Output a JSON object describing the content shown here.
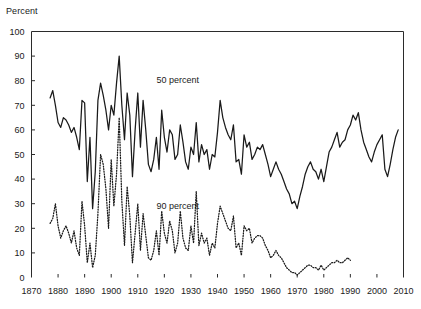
{
  "chart_data": {
    "type": "line",
    "title": "",
    "xlabel": "",
    "ylabel": "Percent",
    "ylim": [
      0,
      100
    ],
    "xlim": [
      1870,
      2010
    ],
    "grid": false,
    "legend_position": "inline-annotation",
    "yticks": [
      0,
      10,
      20,
      30,
      40,
      50,
      60,
      70,
      80,
      90,
      100
    ],
    "xticks": [
      1870,
      1880,
      1890,
      1900,
      1910,
      1920,
      1930,
      1940,
      1950,
      1960,
      1970,
      1980,
      1990,
      2000,
      2010
    ],
    "ytick_labels": [
      "0",
      "10",
      "20",
      "30",
      "40",
      "50",
      "60",
      "70",
      "80",
      "90",
      "100"
    ],
    "xtick_labels": [
      "1870",
      "1880",
      "1890",
      "1900",
      "1910",
      "1920",
      "1930",
      "1940",
      "1950",
      "1960",
      "1970",
      "1980",
      "1990",
      "2000",
      "2010"
    ],
    "annotations": [
      {
        "text": "50 percent",
        "x": 1917,
        "y": 79
      },
      {
        "text": "90 percent",
        "x": 1917,
        "y": 28
      }
    ],
    "series": [
      {
        "name": "50 percent",
        "style": "solid",
        "color": "#1a1a1a",
        "x": [
          1877,
          1878,
          1879,
          1880,
          1881,
          1882,
          1883,
          1884,
          1885,
          1886,
          1887,
          1888,
          1889,
          1890,
          1891,
          1892,
          1893,
          1894,
          1895,
          1896,
          1897,
          1898,
          1899,
          1900,
          1901,
          1902,
          1903,
          1904,
          1905,
          1906,
          1907,
          1908,
          1909,
          1910,
          1911,
          1912,
          1913,
          1914,
          1915,
          1916,
          1917,
          1918,
          1919,
          1920,
          1921,
          1922,
          1923,
          1924,
          1925,
          1926,
          1927,
          1928,
          1929,
          1930,
          1931,
          1932,
          1933,
          1934,
          1935,
          1936,
          1937,
          1938,
          1939,
          1940,
          1941,
          1942,
          1943,
          1944,
          1945,
          1946,
          1947,
          1948,
          1949,
          1950,
          1951,
          1952,
          1953,
          1954,
          1955,
          1956,
          1957,
          1958,
          1959,
          1960,
          1961,
          1962,
          1963,
          1964,
          1965,
          1966,
          1967,
          1968,
          1969,
          1970,
          1971,
          1972,
          1973,
          1974,
          1975,
          1976,
          1977,
          1978,
          1979,
          1980,
          1981,
          1982,
          1983,
          1984,
          1985,
          1986,
          1987,
          1988,
          1989,
          1990,
          1991,
          1992,
          1993,
          1994,
          1995,
          1996,
          1997,
          1998,
          1999,
          2000,
          2001,
          2002,
          2003,
          2004,
          2005,
          2006,
          2007,
          2008
        ],
        "values": [
          73,
          76,
          70,
          63,
          61,
          65,
          64,
          62,
          59,
          61,
          57,
          52,
          72,
          71,
          39,
          57,
          28,
          43,
          72,
          79,
          74,
          68,
          60,
          70,
          66,
          79,
          90,
          70,
          56,
          75,
          66,
          41,
          60,
          75,
          53,
          72,
          60,
          46,
          43,
          48,
          57,
          44,
          68,
          57,
          51,
          60,
          58,
          48,
          50,
          62,
          55,
          47,
          44,
          53,
          50,
          63,
          47,
          54,
          50,
          52,
          44,
          50,
          49,
          59,
          72,
          65,
          61,
          58,
          56,
          62,
          47,
          48,
          42,
          58,
          53,
          55,
          48,
          50,
          53,
          52,
          54,
          50,
          46,
          41,
          44,
          47,
          44,
          42,
          39,
          36,
          34,
          30,
          31,
          28,
          33,
          37,
          42,
          45,
          47,
          44,
          43,
          40,
          44,
          39,
          45,
          51,
          53,
          56,
          59,
          53,
          55,
          56,
          60,
          62,
          66,
          64,
          67,
          60,
          55,
          52,
          49,
          47,
          51,
          54,
          56,
          58,
          44,
          41,
          46,
          52,
          57,
          60
        ],
        "start_year": 1877,
        "end_year": 2008
      },
      {
        "name": "90 percent",
        "style": "dotted",
        "color": "#1a1a1a",
        "x": [
          1877,
          1878,
          1879,
          1880,
          1881,
          1882,
          1883,
          1884,
          1885,
          1886,
          1887,
          1888,
          1889,
          1890,
          1891,
          1892,
          1893,
          1894,
          1895,
          1896,
          1897,
          1898,
          1899,
          1900,
          1901,
          1902,
          1903,
          1904,
          1905,
          1906,
          1907,
          1908,
          1909,
          1910,
          1911,
          1912,
          1913,
          1914,
          1915,
          1916,
          1917,
          1918,
          1919,
          1920,
          1921,
          1922,
          1923,
          1924,
          1925,
          1926,
          1927,
          1928,
          1929,
          1930,
          1931,
          1932,
          1933,
          1934,
          1935,
          1936,
          1937,
          1938,
          1939,
          1940,
          1941,
          1942,
          1943,
          1944,
          1945,
          1946,
          1947,
          1948,
          1949,
          1950,
          1951,
          1952,
          1953,
          1954,
          1955,
          1956,
          1957,
          1958,
          1959,
          1960,
          1961,
          1962,
          1963,
          1964,
          1965,
          1966,
          1967,
          1968,
          1969,
          1970,
          1971,
          1972,
          1973,
          1974,
          1975,
          1976,
          1977,
          1978,
          1979,
          1980,
          1981,
          1982,
          1983,
          1984,
          1985,
          1986,
          1987,
          1988,
          1989,
          1990
        ],
        "values": [
          22,
          24,
          30,
          21,
          16,
          19,
          21,
          18,
          14,
          19,
          12,
          9,
          31,
          21,
          6,
          14,
          4,
          9,
          26,
          50,
          46,
          36,
          20,
          48,
          29,
          42,
          65,
          31,
          13,
          37,
          25,
          6,
          18,
          30,
          11,
          26,
          17,
          8,
          7,
          11,
          19,
          9,
          27,
          18,
          14,
          23,
          19,
          10,
          14,
          27,
          16,
          12,
          11,
          21,
          14,
          35,
          13,
          18,
          14,
          16,
          9,
          14,
          12,
          22,
          29,
          26,
          23,
          20,
          19,
          25,
          12,
          14,
          9,
          21,
          19,
          20,
          14,
          16,
          17,
          17,
          16,
          13,
          11,
          8,
          9,
          11,
          9,
          8,
          6,
          4,
          3,
          2,
          2,
          1,
          2,
          3,
          4,
          5,
          5,
          4,
          4,
          3,
          5,
          3,
          4,
          5,
          6,
          6,
          7,
          6,
          6,
          7,
          8,
          7
        ],
        "start_year": 1877,
        "end_year": 1990
      }
    ]
  }
}
